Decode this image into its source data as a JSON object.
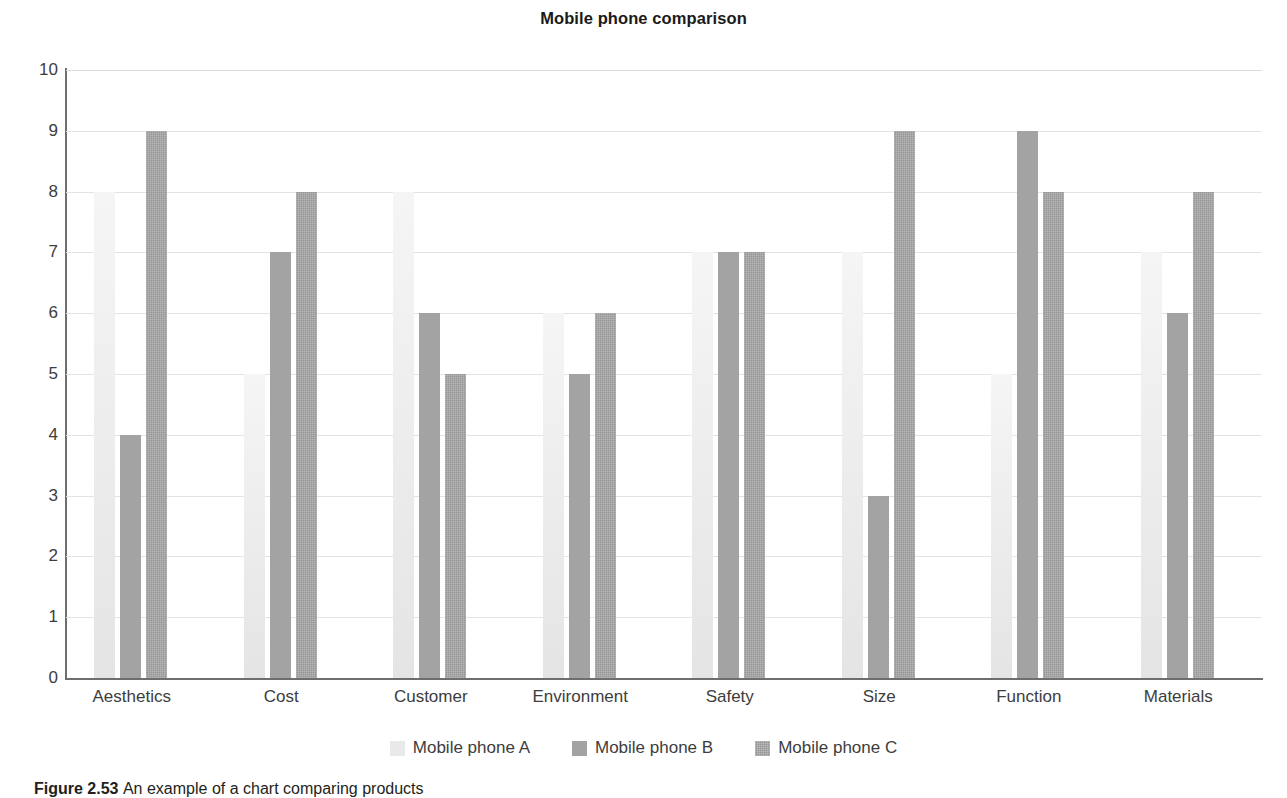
{
  "figure": {
    "title": "Mobile phone comparison",
    "caption_label": "Figure 2.53",
    "caption_text": "An example of a chart comparing products"
  },
  "axes": {
    "y_ticks": [
      "10",
      "9",
      "8",
      "7",
      "6",
      "5",
      "4",
      "3",
      "2",
      "1",
      "0"
    ],
    "x_categories": [
      "Aesthetics",
      "Cost",
      "Customer",
      "Environment",
      "Safety",
      "Size",
      "Function",
      "Materials"
    ]
  },
  "legend": {
    "items": [
      {
        "label": "Mobile phone A",
        "swatch": "series-a",
        "color": "#e9e9e9"
      },
      {
        "label": "Mobile phone B",
        "swatch": "series-b",
        "color": "#a3a3a3"
      },
      {
        "label": "Mobile phone C",
        "swatch": "series-c",
        "color": "#969696"
      }
    ]
  },
  "chart_data": {
    "type": "bar",
    "title": "Mobile phone comparison",
    "xlabel": "",
    "ylabel": "",
    "ylim": [
      0,
      10
    ],
    "ytick_step": 1,
    "grid": true,
    "legend_position": "bottom",
    "categories": [
      "Aesthetics",
      "Cost",
      "Customer",
      "Environment",
      "Safety",
      "Size",
      "Function",
      "Materials"
    ],
    "series": [
      {
        "name": "Mobile phone A",
        "color": "#e9e9e9",
        "values": [
          8,
          5,
          8,
          6,
          7,
          7,
          5,
          7
        ]
      },
      {
        "name": "Mobile phone B",
        "color": "#a3a3a3",
        "values": [
          4,
          7,
          6,
          5,
          7,
          3,
          9,
          6
        ]
      },
      {
        "name": "Mobile phone C",
        "color": "#969696",
        "values": [
          9,
          8,
          5,
          6,
          7,
          9,
          8,
          8
        ]
      }
    ]
  }
}
